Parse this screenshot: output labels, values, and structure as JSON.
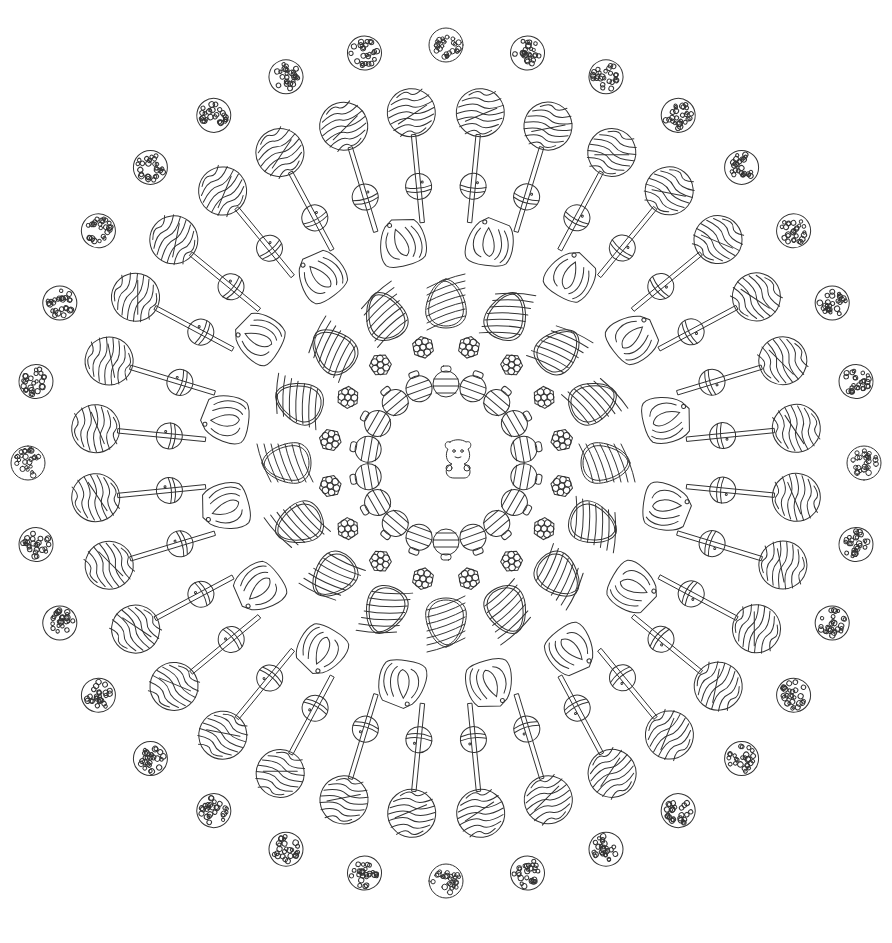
{
  "image": {
    "title": "",
    "description": "Candy mandala coloring page (line art)",
    "width": 892,
    "height": 943,
    "background": "#ffffff",
    "stroke_color": "#333333",
    "center": [
      446,
      463
    ]
  },
  "center_piece": {
    "type": "gummy-bear",
    "x": 458,
    "y": 458,
    "size": 1
  },
  "rings": [
    {
      "name": "gumdrop-ring",
      "type": "gumdrop",
      "count": 18,
      "radius": 82,
      "offset_deg": 0,
      "size": 1
    },
    {
      "name": "hard-candy-ring",
      "type": "flower-candy",
      "count": 16,
      "radius": 118,
      "offset_deg": 11.25,
      "size": 1
    },
    {
      "name": "striped-egg-ring",
      "type": "striped-egg",
      "count": 16,
      "radius": 160,
      "offset_deg": 0,
      "size": 1
    },
    {
      "name": "wrapped-candy-ring",
      "type": "wrapped-candy",
      "count": 16,
      "radius": 225,
      "offset_deg": 11.25,
      "size": 1
    },
    {
      "name": "gumball-inner-ring",
      "type": "gumball",
      "count": 32,
      "radius": 278,
      "offset_deg": 5.6,
      "size": 1
    },
    {
      "name": "lollipop-ring",
      "type": "lollipop",
      "count": 32,
      "radius": 352,
      "stick_inner_radius": 242,
      "offset_deg": 5.6,
      "size": 1
    },
    {
      "name": "sprinkle-ball-ring",
      "type": "sprinkle-ball",
      "count": 32,
      "radius": 418,
      "offset_deg": 0,
      "size": 1
    }
  ],
  "text": []
}
